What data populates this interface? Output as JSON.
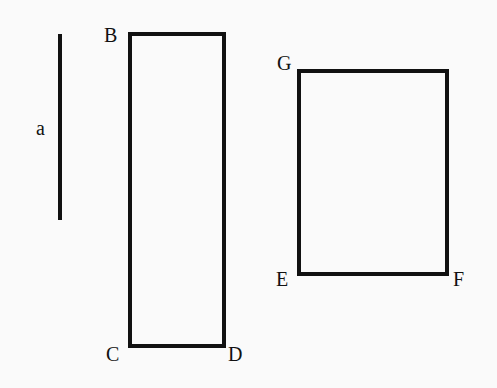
{
  "diagram": {
    "stroke_color": "#111111",
    "background": "#fafafa",
    "segment_a": {
      "label": "a",
      "x": 60,
      "y1": 34,
      "y2": 220
    },
    "rect_bcd": {
      "x": 130,
      "y": 34,
      "width": 94,
      "height": 312,
      "labels": {
        "B": "B",
        "C": "C",
        "D": "D"
      }
    },
    "rect_efg": {
      "x": 299,
      "y": 71,
      "width": 148,
      "height": 203,
      "labels": {
        "G": "G",
        "E": "E",
        "F": "F"
      }
    }
  }
}
